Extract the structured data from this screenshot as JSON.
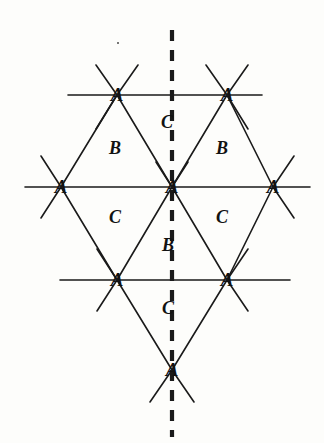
{
  "figure": {
    "background_color": "#fdfdfb",
    "ink_color": "#1a1a1a",
    "stroke_width": 1.6,
    "dashed_axis": {
      "name": "mirror-axis",
      "orientation": "vertical",
      "x": 172,
      "y_start": 30,
      "y_end": 437,
      "dash_pattern": "11 9",
      "stroke_width": 4.2,
      "color": "#1a1a1a"
    },
    "vertices": [
      {
        "id": "a-top-left",
        "label": "A",
        "x": 117,
        "y": 95
      },
      {
        "id": "a-top-right",
        "label": "A",
        "x": 227,
        "y": 95
      },
      {
        "id": "a-mid-left",
        "label": "A",
        "x": 61,
        "y": 187
      },
      {
        "id": "a-center",
        "label": "A",
        "x": 172,
        "y": 187
      },
      {
        "id": "a-mid-right",
        "label": "A",
        "x": 273,
        "y": 187
      },
      {
        "id": "a-bottom-left",
        "label": "A",
        "x": 117,
        "y": 280
      },
      {
        "id": "a-bottom-right",
        "label": "A",
        "x": 227,
        "y": 280
      },
      {
        "id": "a-apex-bottom",
        "label": "A",
        "x": 172,
        "y": 370
      }
    ],
    "region_labels": [
      {
        "id": "c-top-center",
        "label": "C",
        "x": 167,
        "y": 122
      },
      {
        "id": "b-upper-left",
        "label": "B",
        "x": 115,
        "y": 148
      },
      {
        "id": "b-upper-right",
        "label": "B",
        "x": 222,
        "y": 148
      },
      {
        "id": "c-lower-left",
        "label": "C",
        "x": 115,
        "y": 217
      },
      {
        "id": "c-lower-right",
        "label": "C",
        "x": 222,
        "y": 217
      },
      {
        "id": "b-bottom-center",
        "label": "B",
        "x": 168,
        "y": 245
      },
      {
        "id": "c-bottom-center",
        "label": "C",
        "x": 168,
        "y": 308
      }
    ],
    "horizontal_lines": [
      {
        "id": "row-top",
        "x1": 68,
        "x2": 262,
        "y": 95
      },
      {
        "id": "row-middle",
        "x1": 25,
        "x2": 310,
        "y": 187
      },
      {
        "id": "row-bottom",
        "x1": 60,
        "x2": 290,
        "y": 280
      }
    ],
    "edges": [
      {
        "id": "edge-topleft-center",
        "x1": 117,
        "y1": 95,
        "x2": 172,
        "y2": 187
      },
      {
        "id": "edge-topright-center",
        "x1": 227,
        "y1": 95,
        "x2": 172,
        "y2": 187
      },
      {
        "id": "edge-topleft-midleft",
        "x1": 117,
        "y1": 95,
        "x2": 61,
        "y2": 187
      },
      {
        "id": "edge-topright-midright",
        "x1": 227,
        "y1": 95,
        "x2": 273,
        "y2": 187
      },
      {
        "id": "edge-midleft-bottomleft",
        "x1": 61,
        "y1": 187,
        "x2": 117,
        "y2": 280
      },
      {
        "id": "edge-center-bottomleft",
        "x1": 172,
        "y1": 187,
        "x2": 117,
        "y2": 280
      },
      {
        "id": "edge-center-bottomright",
        "x1": 172,
        "y1": 187,
        "x2": 227,
        "y2": 280
      },
      {
        "id": "edge-midright-bottomright",
        "x1": 273,
        "y1": 187,
        "x2": 227,
        "y2": 280
      },
      {
        "id": "edge-bottomleft-apex",
        "x1": 117,
        "y1": 280,
        "x2": 172,
        "y2": 370
      },
      {
        "id": "edge-bottomright-apex",
        "x1": 227,
        "y1": 280,
        "x2": 172,
        "y2": 370
      }
    ],
    "stub_rays": [
      {
        "id": "stub-topleft-nw",
        "x": 117,
        "y": 95,
        "dx": -21,
        "dy": -30
      },
      {
        "id": "stub-topleft-ne",
        "x": 117,
        "y": 95,
        "dx": 21,
        "dy": -30
      },
      {
        "id": "stub-topright-nw",
        "x": 227,
        "y": 95,
        "dx": -21,
        "dy": -30
      },
      {
        "id": "stub-topright-ne",
        "x": 227,
        "y": 95,
        "dx": 21,
        "dy": -30
      },
      {
        "id": "stub-topleft-sw",
        "x": 117,
        "y": 95,
        "dx": -21,
        "dy": 34
      },
      {
        "id": "stub-topright-se",
        "x": 227,
        "y": 95,
        "dx": 21,
        "dy": 34
      },
      {
        "id": "stub-midleft-nw",
        "x": 61,
        "y": 187,
        "dx": -20,
        "dy": -31
      },
      {
        "id": "stub-midleft-sw",
        "x": 61,
        "y": 187,
        "dx": -20,
        "dy": 31
      },
      {
        "id": "stub-midright-ne",
        "x": 273,
        "y": 187,
        "dx": 21,
        "dy": -31
      },
      {
        "id": "stub-midright-se",
        "x": 273,
        "y": 187,
        "dx": 21,
        "dy": 31
      },
      {
        "id": "stub-bottomleft-sw",
        "x": 117,
        "y": 280,
        "dx": -20,
        "dy": 31
      },
      {
        "id": "stub-bottomright-se",
        "x": 227,
        "y": 280,
        "dx": 21,
        "dy": 31
      },
      {
        "id": "stub-bottomleft-nw",
        "x": 117,
        "y": 280,
        "dx": -20,
        "dy": -31
      },
      {
        "id": "stub-bottomright-ne",
        "x": 227,
        "y": 280,
        "dx": 21,
        "dy": -31
      },
      {
        "id": "stub-apex-sw",
        "x": 172,
        "y": 370,
        "dx": -22,
        "dy": 32
      },
      {
        "id": "stub-apex-se",
        "x": 172,
        "y": 370,
        "dx": 22,
        "dy": 32
      },
      {
        "id": "stub-center-nw-short",
        "x": 172,
        "y": 187,
        "dx": -16,
        "dy": -25
      },
      {
        "id": "stub-center-ne-short",
        "x": 172,
        "y": 187,
        "dx": 16,
        "dy": -25
      }
    ],
    "speck": {
      "id": "ink-speck",
      "x": 117,
      "y": 42
    }
  }
}
